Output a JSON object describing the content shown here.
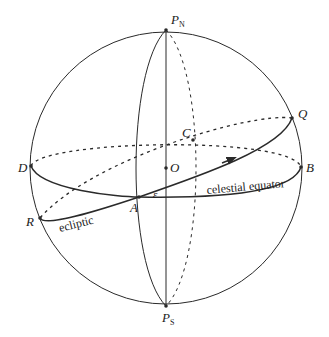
{
  "diagram": {
    "colors": {
      "stroke": "#2a2a2a",
      "background": "#ffffff"
    },
    "points": {
      "north_pole": {
        "label": "P",
        "subscript": "N"
      },
      "south_pole": {
        "label": "P",
        "subscript": "S"
      },
      "center": {
        "label": "O"
      },
      "A": {
        "label": "A"
      },
      "B": {
        "label": "B"
      },
      "C": {
        "label": "C"
      },
      "D": {
        "label": "D"
      },
      "Q": {
        "label": "Q"
      },
      "R": {
        "label": "R"
      }
    },
    "angle_label": "ε",
    "curve_labels": {
      "celestial_equator": "celestial equator",
      "ecliptic": "ecliptic"
    }
  }
}
